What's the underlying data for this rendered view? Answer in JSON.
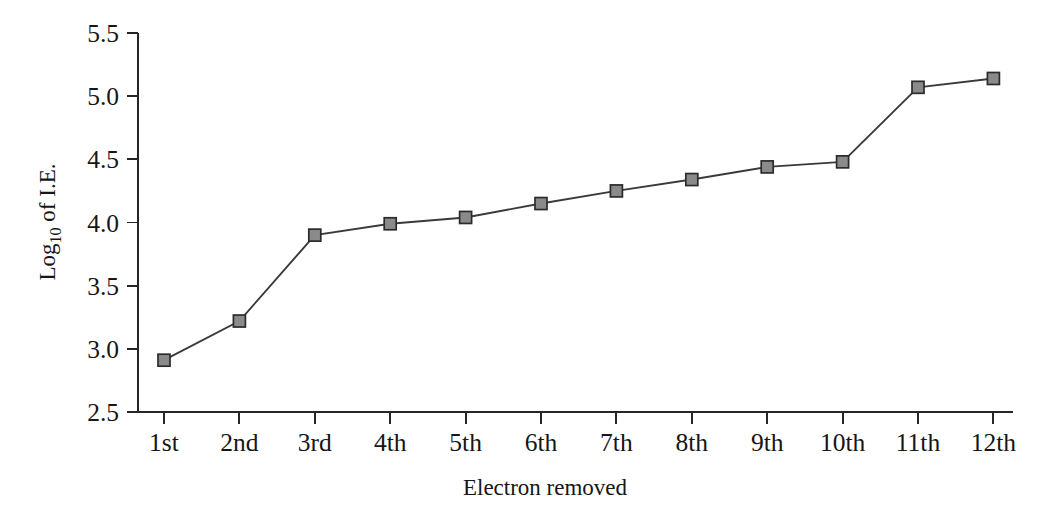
{
  "chart_data": {
    "type": "line",
    "title": "",
    "subtitle": "",
    "xlabel": "Electron removed",
    "ylabel": "Log10 of I.E.",
    "ylabel_base": "Log",
    "ylabel_sub": "10",
    "ylabel_tail": " of I.E.",
    "categories": [
      "1st",
      "2nd",
      "3rd",
      "4th",
      "5th",
      "6th",
      "7th",
      "8th",
      "9th",
      "10th",
      "11th",
      "12th"
    ],
    "values": [
      2.91,
      3.22,
      3.9,
      3.99,
      4.04,
      4.15,
      4.25,
      4.34,
      4.44,
      4.48,
      5.07,
      5.14
    ],
    "series": [
      {
        "name": "Log10 of I.E.",
        "values": [
          2.91,
          3.22,
          3.9,
          3.99,
          4.04,
          4.15,
          4.25,
          4.34,
          4.44,
          4.48,
          5.07,
          5.14
        ]
      }
    ],
    "ylim": [
      2.5,
      5.5
    ],
    "yticks": [
      2.5,
      3.0,
      3.5,
      4.0,
      4.5,
      5.0,
      5.5
    ],
    "ytick_labels": [
      "2.5",
      "3.0",
      "3.5",
      "4.0",
      "4.5",
      "5.0",
      "5.5"
    ],
    "xticks": [
      "1st",
      "2nd",
      "3rd",
      "4th",
      "5th",
      "6th",
      "7th",
      "8th",
      "9th",
      "10th",
      "11th",
      "12th"
    ],
    "grid": false,
    "legend": false,
    "legend_position": "none",
    "marker": "square",
    "marker_fill": "#8a8a8a",
    "marker_edge": "#2b2b2b",
    "line_color": "#3a3a3a",
    "axis_color": "#262626",
    "background": "#ffffff"
  }
}
